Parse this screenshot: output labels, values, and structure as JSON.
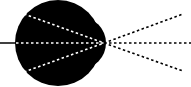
{
  "diagram": {
    "type": "optics-lens-focus",
    "colors": {
      "background": "#ffffff",
      "lens": "#000000",
      "ray_inside": "#ffffff",
      "ray_outside": "#000000",
      "incoming_line": "#000000"
    },
    "lens": {
      "cx": 58,
      "cy": 43,
      "r": 43,
      "bulge_cx": 80,
      "bulge_cy": 43,
      "bulge_r": 26
    },
    "focal_point": {
      "x": 104,
      "y": 43
    },
    "incoming_ray": {
      "x1": 0,
      "y1": 43,
      "x2": 16,
      "y2": 43
    },
    "rays_inside": [
      {
        "x1": 24,
        "y1": 14,
        "x2": 104,
        "y2": 43
      },
      {
        "x1": 16,
        "y1": 43,
        "x2": 104,
        "y2": 43
      },
      {
        "x1": 24,
        "y1": 72,
        "x2": 104,
        "y2": 43
      }
    ],
    "rays_outside": [
      {
        "x1": 104,
        "y1": 43,
        "x2": 183,
        "y2": 14
      },
      {
        "x1": 104,
        "y1": 43,
        "x2": 191,
        "y2": 43
      },
      {
        "x1": 104,
        "y1": 43,
        "x2": 183,
        "y2": 71
      }
    ]
  }
}
